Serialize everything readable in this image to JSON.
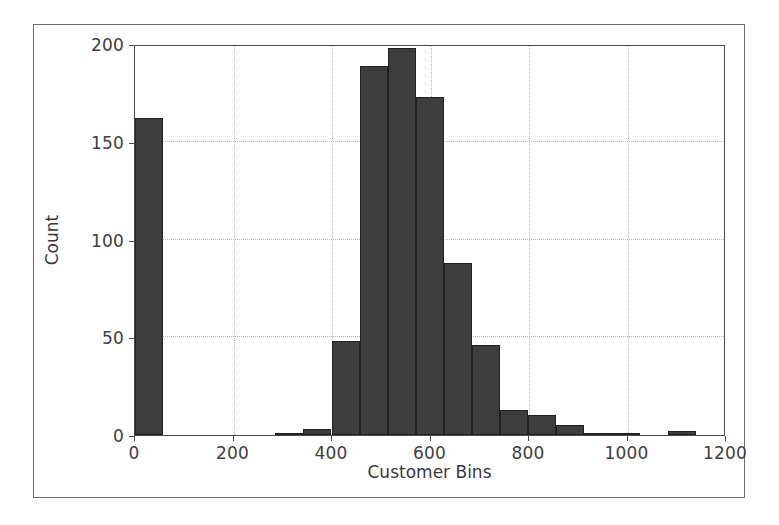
{
  "figure": {
    "background_color": "#ffffff",
    "frame_color": "#6e6e6e",
    "axes_color": "#4a4a4a",
    "grid_color": "#b9b9b9",
    "bar_color": "#3d3d3d",
    "bar_edge_color": "#212121"
  },
  "chart_data": {
    "type": "bar",
    "title": "",
    "xlabel": "Customer Bins",
    "ylabel": "Count",
    "xlim": [
      0,
      1200
    ],
    "ylim": [
      0,
      200
    ],
    "xticks": [
      0,
      200,
      400,
      600,
      800,
      1000,
      1200
    ],
    "xticklabels": [
      "0",
      "200",
      "400",
      "600",
      "800",
      "1000",
      "1200"
    ],
    "yticks": [
      0,
      50,
      100,
      150,
      200
    ],
    "yticklabels": [
      "0",
      "50",
      "100",
      "150",
      "200"
    ],
    "grid": true,
    "grid_style": "dotted",
    "legend": null,
    "bin_width": 57,
    "bin_edges": [
      0,
      57,
      114,
      171,
      228,
      285,
      342,
      399,
      456,
      513,
      570,
      627,
      684,
      741,
      798,
      855,
      912,
      969,
      1026,
      1083,
      1140,
      1197
    ],
    "categories": [
      "0-57",
      "57-114",
      "114-171",
      "171-228",
      "228-285",
      "285-342",
      "342-399",
      "399-456",
      "456-513",
      "513-570",
      "570-627",
      "627-684",
      "684-741",
      "741-798",
      "798-855",
      "855-912",
      "912-969",
      "969-1026",
      "1026-1083",
      "1083-1140",
      "1140-1197"
    ],
    "values": [
      162,
      0,
      0,
      0,
      0,
      1,
      3,
      48,
      189,
      198,
      173,
      88,
      46,
      13,
      10,
      5,
      1,
      1,
      0,
      2,
      0
    ]
  }
}
